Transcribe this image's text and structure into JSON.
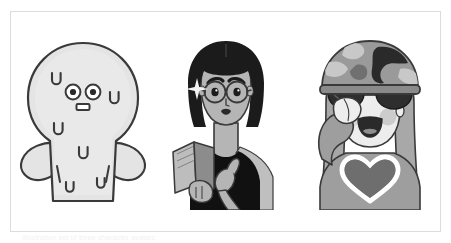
{
  "page": {
    "background_color": "#ffffff",
    "frame_border_color": "#dcdcdc",
    "caption": "Illustration set of three character avatars"
  },
  "palette": {
    "outline": "#3a3a3a",
    "blob_body": "#e4e4e4",
    "blob_body_shade": "#d6d6d6",
    "skin": "#b5b5b5",
    "skin_light": "#c9c9c9",
    "hair_dark": "#1b1b1b",
    "top_black": "#111111",
    "book_gray": "#8c8c8c",
    "book_page": "#bdbdbd",
    "helmet_base": "#9a9a9a",
    "helmet_patch": "#2a2a2a",
    "helmet_patch_light": "#c4c4c4",
    "hair_gray": "#a8a8a8",
    "shirt_gray": "#9e9e9e",
    "heart_gray": "#6e6e6e",
    "face_light": "#ededed",
    "cheek": "#c8c8c8",
    "white": "#ffffff"
  },
  "illustrations": [
    {
      "id": "blob-creature",
      "name": "Gray blob creature with U marks",
      "description": "Round-headed pale gray blob figure with two round eyes, a small rectangular mouth, stubby mitten arms, and scattered U-shaped marks on its body",
      "features": {
        "eyes": 2,
        "mouth": "small rectangle",
        "u_marks": 6,
        "arms": "mitten-shaped",
        "body_color": "#e4e4e4"
      }
    },
    {
      "id": "woman-reading",
      "name": "Woman with glasses holding a book",
      "description": "Woman with a dark bob haircut, round glasses, arched eyebrows, dark lips, wearing a black sleeveless top and holding an open gray book",
      "features": {
        "hair": "dark bob",
        "glasses": "round wire-frame",
        "top": "black sleeveless",
        "holding": "open book",
        "sparkle": 1
      }
    },
    {
      "id": "saluting-soldier",
      "name": "Saluting figure in camouflage helmet",
      "description": "Smiling figure with long gray hair wearing a camouflage helmet and dark sunglasses, saluting with one hand, wearing a gray shirt with a heart emblem",
      "features": {
        "helmet": "camouflage",
        "sunglasses": "dark wide",
        "hair": "long gray",
        "gesture": "salute",
        "shirt_emblem": "heart",
        "cheeks": 2
      }
    }
  ]
}
